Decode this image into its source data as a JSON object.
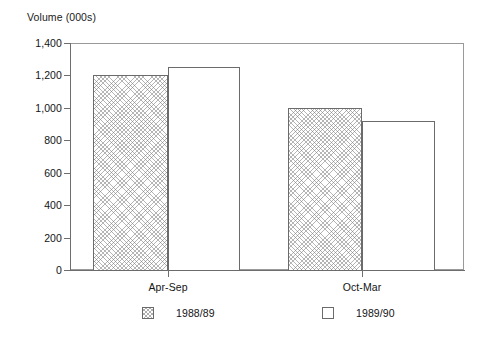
{
  "chart_data": {
    "type": "bar",
    "title": "",
    "ylabel": "Volume (000s)",
    "xlabel": "",
    "categories": [
      "Apr-Sep",
      "Oct-Mar"
    ],
    "series": [
      {
        "name": "1988/89",
        "values": [
          1200,
          1000
        ],
        "fill": "hatched"
      },
      {
        "name": "1989/90",
        "values": [
          1250,
          920
        ],
        "fill": "plain"
      }
    ],
    "ylim": [
      0,
      1400
    ],
    "ytick_values": [
      0,
      200,
      400,
      600,
      800,
      1000,
      1200,
      1400
    ],
    "ytick_labels": [
      "0",
      "200",
      "400",
      "600",
      "800",
      "1,000",
      "1,200",
      "1,400"
    ],
    "grid": false,
    "legend_position": "bottom",
    "frame": true
  },
  "colors": {
    "axis": "#6e6e6e",
    "frame": "#9a9a9a",
    "bar_outline": "#6b6b6b",
    "text": "#141414",
    "background": "#ffffff"
  }
}
